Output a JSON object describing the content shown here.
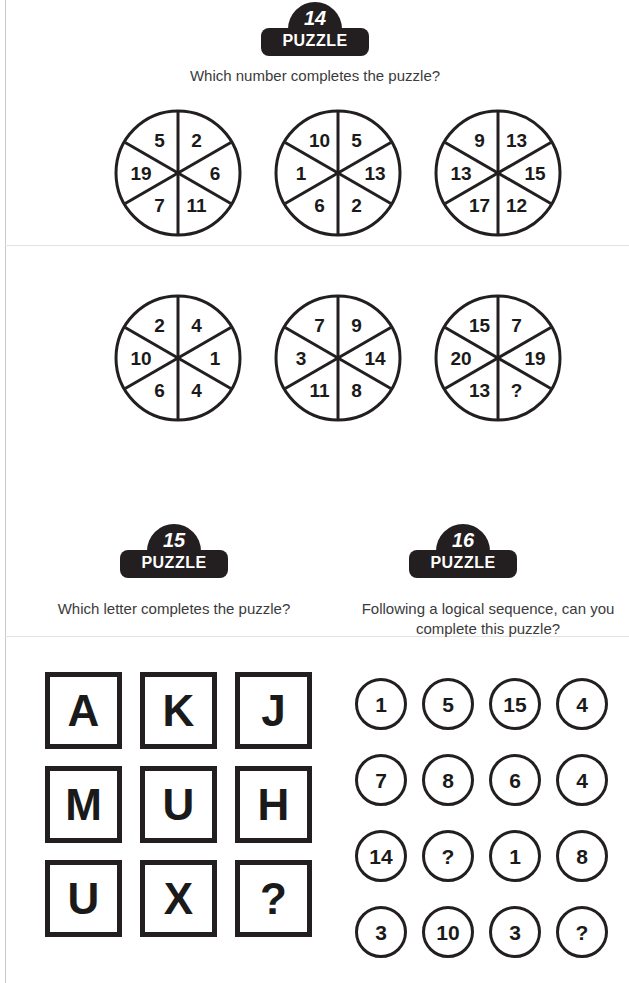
{
  "page": {
    "background": "#ffffff",
    "ink": "#231f20"
  },
  "puzzles": [
    {
      "id": "puzzle-14",
      "badge_number": "14",
      "badge_word": "PUZZLE",
      "question": "Which number completes the puzzle?",
      "type": "six-segment-circles",
      "circles": [
        {
          "name": "circle-1",
          "segments": [
            "5",
            "2",
            "6",
            "11",
            "7",
            "19"
          ]
        },
        {
          "name": "circle-2",
          "segments": [
            "10",
            "5",
            "13",
            "2",
            "6",
            "1"
          ]
        },
        {
          "name": "circle-3",
          "segments": [
            "9",
            "13",
            "15",
            "12",
            "17",
            "13"
          ]
        },
        {
          "name": "circle-4",
          "segments": [
            "2",
            "4",
            "1",
            "4",
            "6",
            "10"
          ]
        },
        {
          "name": "circle-5",
          "segments": [
            "7",
            "9",
            "14",
            "8",
            "11",
            "3"
          ]
        },
        {
          "name": "circle-6",
          "segments": [
            "15",
            "7",
            "19",
            "?",
            "13",
            "20"
          ]
        }
      ]
    },
    {
      "id": "puzzle-15",
      "badge_number": "15",
      "badge_word": "PUZZLE",
      "question": "Which letter completes the puzzle?",
      "type": "letter-grid",
      "rows": [
        [
          "A",
          "K",
          "J"
        ],
        [
          "M",
          "U",
          "H"
        ],
        [
          "U",
          "X",
          "?"
        ]
      ]
    },
    {
      "id": "puzzle-16",
      "badge_number": "16",
      "badge_word": "PUZZLE",
      "question": "Following a logical sequence, can you complete this puzzle?",
      "type": "number-circle-grid",
      "rows": [
        [
          "1",
          "5",
          "15",
          "4"
        ],
        [
          "7",
          "8",
          "6",
          "4"
        ],
        [
          "14",
          "?",
          "1",
          "8"
        ],
        [
          "3",
          "10",
          "3",
          "?"
        ]
      ]
    }
  ]
}
